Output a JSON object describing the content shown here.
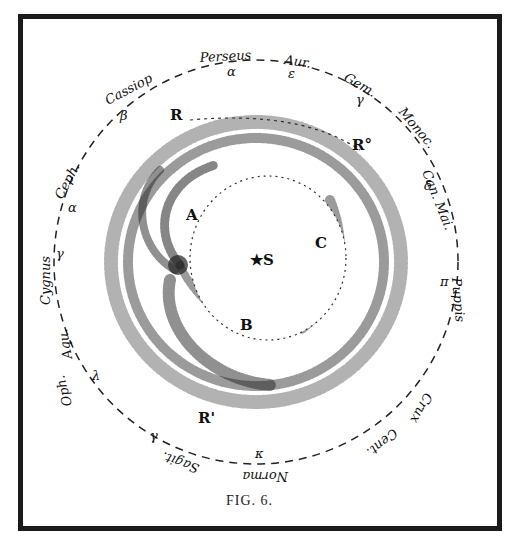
{
  "figure": {
    "caption": "FIG. 6.",
    "center_label": "★S",
    "region_labels": {
      "A": "A",
      "B": "B",
      "C": "C",
      "R_top": "R",
      "R_upper_right": "R°",
      "R_bottom": "R'"
    },
    "constellations": [
      {
        "name": "Perseus",
        "star": "α"
      },
      {
        "name": "Aur.",
        "star": "ε"
      },
      {
        "name": "Gem.",
        "star": "γ"
      },
      {
        "name": "Monoc.",
        "star": ""
      },
      {
        "name": "Can. Mai.",
        "star": "δ"
      },
      {
        "name": "Puppis",
        "star": "π"
      },
      {
        "name": "Crux",
        "star": "α"
      },
      {
        "name": "Cent.",
        "star": "α"
      },
      {
        "name": "Norma",
        "star": "κ"
      },
      {
        "name": "Sagit.",
        "star": "γ"
      },
      {
        "name": "Oph.",
        "star": "θ"
      },
      {
        "name": "Aqu.",
        "star": "λ"
      },
      {
        "name": "Cygnus",
        "star": "γ"
      },
      {
        "name": "Ceph.",
        "star": "α"
      },
      {
        "name": "Cassiop",
        "star": "β"
      }
    ],
    "colors": {
      "ink": "#111111",
      "border": "#1a1a1a",
      "paper": "#ffffff"
    }
  }
}
